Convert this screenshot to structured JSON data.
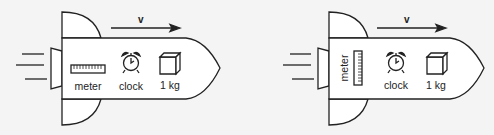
{
  "figure": {
    "panels": [
      {
        "id": "left",
        "velocity_label": "v",
        "items": [
          {
            "name": "meter",
            "label": "meter",
            "orientation": "horizontal"
          },
          {
            "name": "clock",
            "label": "clock"
          },
          {
            "name": "mass",
            "label": "1 kg"
          }
        ]
      },
      {
        "id": "right",
        "velocity_label": "v",
        "items": [
          {
            "name": "meter",
            "label": "meter",
            "orientation": "vertical"
          },
          {
            "name": "clock",
            "label": "clock"
          },
          {
            "name": "mass",
            "label": "1 kg"
          }
        ]
      }
    ],
    "colors": {
      "line": "#222222",
      "fill": "#ffffff",
      "background": "#f4f4f4"
    }
  }
}
